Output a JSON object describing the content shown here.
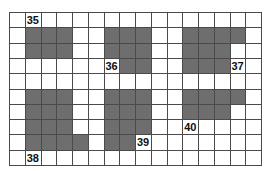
{
  "grid": {
    "columns": 16,
    "rows": 10,
    "shade_color": "#6e6e6e",
    "line_color": "#4a4a4a",
    "background_color": "#ffffff",
    "shaded_cells": [
      [
        1,
        1
      ],
      [
        1,
        2
      ],
      [
        1,
        3
      ],
      [
        1,
        6
      ],
      [
        1,
        7
      ],
      [
        1,
        8
      ],
      [
        1,
        11
      ],
      [
        1,
        12
      ],
      [
        1,
        13
      ],
      [
        1,
        14
      ],
      [
        2,
        1
      ],
      [
        2,
        2
      ],
      [
        2,
        3
      ],
      [
        2,
        6
      ],
      [
        2,
        7
      ],
      [
        2,
        8
      ],
      [
        2,
        11
      ],
      [
        2,
        12
      ],
      [
        2,
        13
      ],
      [
        3,
        7
      ],
      [
        3,
        8
      ],
      [
        3,
        11
      ],
      [
        3,
        12
      ],
      [
        3,
        13
      ],
      [
        5,
        1
      ],
      [
        5,
        2
      ],
      [
        5,
        3
      ],
      [
        5,
        6
      ],
      [
        5,
        7
      ],
      [
        5,
        8
      ],
      [
        5,
        11
      ],
      [
        5,
        12
      ],
      [
        5,
        13
      ],
      [
        5,
        14
      ],
      [
        6,
        1
      ],
      [
        6,
        2
      ],
      [
        6,
        3
      ],
      [
        6,
        6
      ],
      [
        6,
        7
      ],
      [
        6,
        8
      ],
      [
        6,
        11
      ],
      [
        6,
        12
      ],
      [
        6,
        13
      ],
      [
        7,
        1
      ],
      [
        7,
        2
      ],
      [
        7,
        3
      ],
      [
        7,
        6
      ],
      [
        7,
        7
      ],
      [
        7,
        8
      ],
      [
        8,
        1
      ],
      [
        8,
        2
      ],
      [
        8,
        3
      ],
      [
        8,
        4
      ],
      [
        8,
        6
      ],
      [
        8,
        7
      ]
    ],
    "labels": [
      {
        "row": 0,
        "col": 1,
        "text": "35"
      },
      {
        "row": 3,
        "col": 6,
        "text": "36"
      },
      {
        "row": 3,
        "col": 14,
        "text": "37"
      },
      {
        "row": 9,
        "col": 1,
        "text": "38"
      },
      {
        "row": 8,
        "col": 8,
        "text": "39"
      },
      {
        "row": 7,
        "col": 11,
        "text": "40"
      }
    ]
  }
}
